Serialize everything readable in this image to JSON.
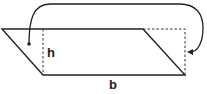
{
  "diagram": {
    "title": "",
    "labels": {
      "height": "h",
      "base": "b"
    },
    "shapes": {
      "parallelogram": {
        "points": [
          [
            2,
            29
          ],
          [
            143,
            29
          ],
          [
            185,
            75
          ],
          [
            43,
            75
          ]
        ]
      },
      "height_line": {
        "x": 43,
        "y1": 29,
        "y2": 75,
        "style": "dashed"
      },
      "moved_triangle_outline": {
        "points": [
          [
            143,
            29
          ],
          [
            185,
            29
          ],
          [
            185,
            75
          ]
        ],
        "style": "dashed"
      },
      "arrow": {
        "from": [
          29,
          44
        ],
        "to": [
          188,
          52
        ],
        "meaning": "move left triangle to right side"
      }
    },
    "colors": {
      "stroke": "#222222",
      "background": "#ffffff"
    }
  }
}
